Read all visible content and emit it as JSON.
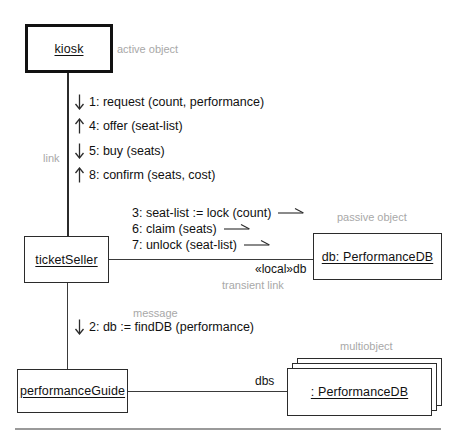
{
  "diagram": {
    "type": "uml-collaboration-diagram",
    "title": "",
    "colors": {
      "line": "#3a3a3a",
      "box_border": "#2b2b2b",
      "text": "#111111",
      "annotation": "#a8a8a8",
      "footer_rule": "#9a9a9a"
    }
  },
  "objects": [
    {
      "id": "kiosk",
      "label": "kiosk",
      "kind": "active object",
      "annotation": "active object"
    },
    {
      "id": "ticketSeller",
      "label": "ticketSeller",
      "kind": "object",
      "annotation": ""
    },
    {
      "id": "performanceGuide",
      "label": "performanceGuide",
      "kind": "object",
      "annotation": ""
    },
    {
      "id": "db",
      "label": "db: PerformanceDB",
      "kind": "passive object",
      "annotation": "passive object"
    },
    {
      "id": "dbs",
      "label": ": PerformanceDB",
      "kind": "multiobject",
      "annotation": "multiobject"
    }
  ],
  "annotations": {
    "active_object": "active object",
    "passive_object": "passive object",
    "multiobject": "multiobject",
    "link": "link",
    "message": "message",
    "transient_link": "transient link"
  },
  "link_labels": {
    "local_db": "«local»db",
    "dbs": "dbs"
  },
  "messages_vertical": [
    {
      "num": "1",
      "text": "1: request (count, performance)",
      "direction": "down"
    },
    {
      "num": "4",
      "text": "4: offer (seat-list)",
      "direction": "up"
    },
    {
      "num": "5",
      "text": "5: buy (seats)",
      "direction": "down"
    },
    {
      "num": "8",
      "text": "8: confirm (seats, cost)",
      "direction": "up"
    }
  ],
  "messages_horizontal": [
    {
      "num": "3",
      "text": "3: seat-list := lock (count)",
      "direction": "right"
    },
    {
      "num": "6",
      "text": "6: claim (seats)",
      "direction": "right"
    },
    {
      "num": "7",
      "text": "7: unlock (seat-list)",
      "direction": "right"
    }
  ],
  "messages_guide": [
    {
      "num": "2",
      "text": "2: db := findDB (performance)",
      "direction": "down"
    }
  ]
}
